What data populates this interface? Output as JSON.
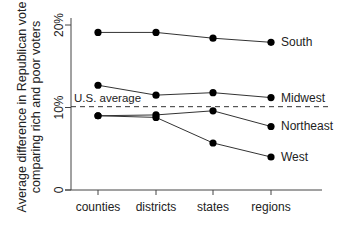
{
  "chart_data": {
    "type": "line",
    "title": "",
    "xlabel": "",
    "ylabel": "Average difference in Republican vote comparing rich and poor voters",
    "ylabel_lines": [
      "Average difference in Republican vote",
      "comparing rich and poor voters"
    ],
    "categories": [
      "counties",
      "districts",
      "states",
      "regions"
    ],
    "yticks": [
      {
        "value": 0,
        "label": "0"
      },
      {
        "value": 10,
        "label": "10%"
      },
      {
        "value": 20,
        "label": "20%"
      }
    ],
    "ylim": [
      0,
      20.5
    ],
    "grid": false,
    "legend": "direct labels at line ends",
    "series": [
      {
        "name": "South",
        "values": [
          19.1,
          19.1,
          18.4,
          17.9
        ]
      },
      {
        "name": "Midwest",
        "values": [
          12.7,
          11.5,
          11.8,
          11.2
        ]
      },
      {
        "name": "Northeast",
        "values": [
          9.0,
          9.1,
          9.6,
          7.7
        ]
      },
      {
        "name": "West",
        "values": [
          9.0,
          8.8,
          5.7,
          4.0
        ]
      }
    ],
    "reference_line": {
      "label": "U.S. average",
      "value": 10.1,
      "style": "dashed"
    }
  }
}
